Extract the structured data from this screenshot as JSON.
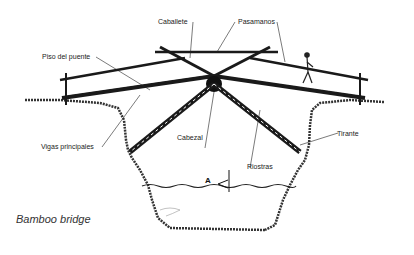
{
  "diagram": {
    "caption": "Bamboo bridge",
    "section_marker": "A",
    "labels": {
      "caballete": "Caballete",
      "pasamanos": "Pasamanos",
      "piso_del_puente": "Piso del puente",
      "vigas_principales": "Vigas principales",
      "cabezal": "Cabezal",
      "riostras": "Riostras",
      "tirante": "Tirante"
    },
    "colors": {
      "ink": "#1a1a1a",
      "background": "#ffffff"
    }
  }
}
